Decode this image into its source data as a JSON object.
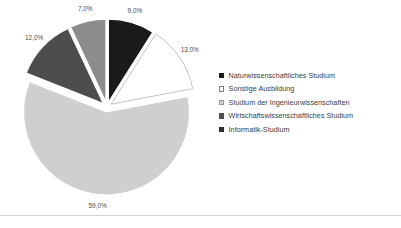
{
  "chart_data": {
    "type": "pie",
    "title": "",
    "xlabel": "",
    "ylabel": "",
    "legend_position": "right",
    "grid": false,
    "exploded": true,
    "value_suffix": "%",
    "decimal_separator": ",",
    "categories": [
      "Naturwissenschaftliches Studium",
      "Sonstige Ausbildung",
      "Studium der Ingenieurwissenschaften",
      "Wirtschaftswissenschaftliches Studium",
      "Informatik-Studium"
    ],
    "values": [
      9.0,
      13.0,
      59.0,
      12.0,
      7.0
    ],
    "labels": [
      "9,0%",
      "13,0%",
      "59,0%",
      "12,0%",
      "7,0%"
    ],
    "colors": [
      "#1a1a1a",
      "#ffffff",
      "#cfcfcf",
      "#4d4d4d",
      "#8c8c8c"
    ],
    "slices": [
      {
        "label": "Naturwissenschaftliches Studium",
        "value": 9.0,
        "display": "9,0%",
        "color": "#1a1a1a",
        "stroke": "#ffffff"
      },
      {
        "label": "Sonstige Ausbildung",
        "value": 13.0,
        "display": "13,0%",
        "color": "#ffffff",
        "stroke": "#b4b4b4"
      },
      {
        "label": "Studium der Ingenieurwissenschaften",
        "value": 59.0,
        "display": "59,0%",
        "color": "#cfcfcf",
        "stroke": "#ffffff"
      },
      {
        "label": "Wirtschaftswissenschaftliches Studium",
        "value": 12.0,
        "display": "12,0%",
        "color": "#4d4d4d",
        "stroke": "#ffffff"
      },
      {
        "label": "Informatik-Studium",
        "value": 7.0,
        "display": "7,0%",
        "color": "#8c8c8c",
        "stroke": "#ffffff"
      }
    ]
  },
  "legend": {
    "items": [
      {
        "label": "Naturwissenschaftliches Studium",
        "color": "#1a1a1a",
        "border": "#1a1a1a"
      },
      {
        "label": "Sonstige Ausbildung",
        "color": "#ffffff",
        "border": "#808080"
      },
      {
        "label": "Studium der Ingenieurwissenschaften",
        "color": "#cfcfcf",
        "border": "#9a9a9a"
      },
      {
        "label": "Wirtschaftswissenschaftliches Studium",
        "color": "#4d4d4d",
        "border": "#4d4d4d"
      },
      {
        "label": "Informatik-Studium",
        "color": "#2e2e2e",
        "border": "#2e2e2e"
      }
    ]
  }
}
